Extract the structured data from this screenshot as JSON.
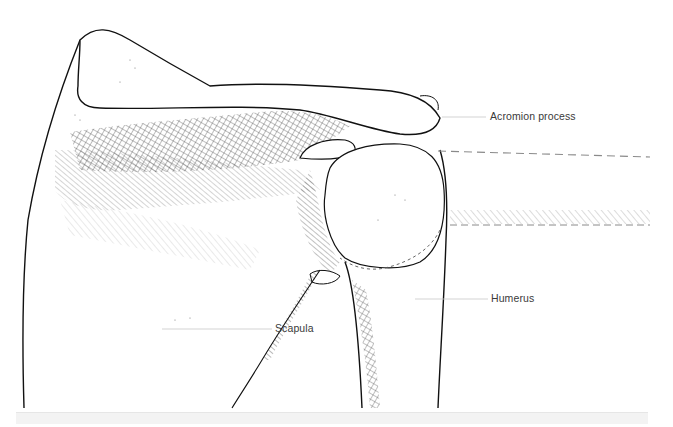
{
  "figure": {
    "style": "pen-and-ink line drawing with hatching",
    "labels": [
      {
        "id": "acromion",
        "text": "Acromion process"
      },
      {
        "id": "humerus",
        "text": "Humerus"
      },
      {
        "id": "scapula",
        "text": "Scapula"
      }
    ],
    "colors": {
      "ink": "#111111",
      "leader_line": "#c8c8c8",
      "label_text": "#3a3a3a",
      "dashed_line": "#8a8a8a",
      "background": "#ffffff"
    }
  }
}
